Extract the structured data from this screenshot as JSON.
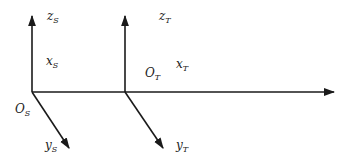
{
  "diagram": {
    "type": "coordinate-frames",
    "colors": {
      "line": "#1a1a1a",
      "text": "#222222",
      "background": "#ffffff"
    },
    "frames": [
      {
        "name": "S",
        "origin": {
          "base": "O",
          "sub": "S"
        },
        "z": {
          "base": "z",
          "sub": "S"
        },
        "x": {
          "base": "x",
          "sub": "S"
        },
        "y": {
          "base": "y",
          "sub": "S"
        }
      },
      {
        "name": "T",
        "origin": {
          "base": "O",
          "sub": "T"
        },
        "z": {
          "base": "z",
          "sub": "T"
        },
        "x": {
          "base": "x",
          "sub": "T"
        },
        "y": {
          "base": "y",
          "sub": "T"
        }
      }
    ]
  }
}
